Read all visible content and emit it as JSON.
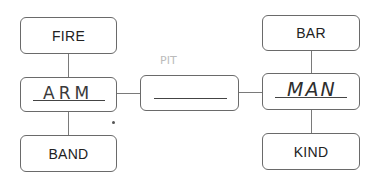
{
  "diagram": {
    "left_column": {
      "top": {
        "label": "FIRE"
      },
      "center": {
        "handwritten": "ARM"
      },
      "bottom": {
        "label": "BAND"
      }
    },
    "middle": {
      "answer_blank": "",
      "faint_mark": "PIT"
    },
    "right_column": {
      "top": {
        "label": "BAR"
      },
      "center": {
        "handwritten": "MAN"
      },
      "bottom": {
        "label": "KIND"
      }
    }
  }
}
